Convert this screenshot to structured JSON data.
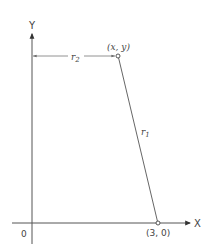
{
  "diagram": {
    "axes": {
      "x_label": "X",
      "y_label": "Y",
      "origin_label": "0"
    },
    "points": [
      {
        "id": "p1",
        "label": "(x, y)"
      },
      {
        "id": "p2",
        "label": "(3, 0)"
      }
    ],
    "segments": [
      {
        "id": "r1",
        "label": "r",
        "subscript": "1"
      },
      {
        "id": "r2",
        "label": "r",
        "subscript": "2"
      }
    ],
    "colors": {
      "line": "#555555",
      "text": "#444444",
      "background": "#ffffff"
    }
  }
}
